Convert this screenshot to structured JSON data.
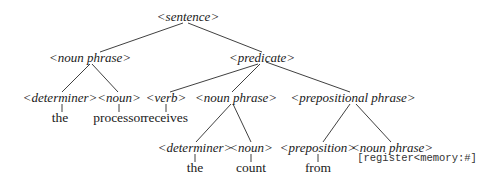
{
  "diagram": {
    "type": "parse-tree",
    "nodes": {
      "sentence": {
        "label": "<sentence>",
        "x": 188,
        "y": 17
      },
      "np1": {
        "label": "<noun phrase>",
        "x": 90,
        "y": 58
      },
      "predicate": {
        "label": "<predicate>",
        "x": 262,
        "y": 58
      },
      "det1": {
        "label": "<determiner>",
        "x": 60,
        "y": 98
      },
      "noun1": {
        "label": "<noun>",
        "x": 119,
        "y": 98
      },
      "verb": {
        "label": "<verb>",
        "x": 166,
        "y": 98
      },
      "np2": {
        "label": "<noun phrase>",
        "x": 236,
        "y": 98
      },
      "pp": {
        "label": "<prepositional phrase>",
        "x": 353,
        "y": 98
      },
      "det2": {
        "label": "<determiner>",
        "x": 195,
        "y": 148
      },
      "noun2": {
        "label": "<noun>",
        "x": 251,
        "y": 148
      },
      "prep": {
        "label": "<preposition>",
        "x": 318,
        "y": 148
      },
      "np3": {
        "label": "<noun phrase>",
        "x": 392,
        "y": 148
      }
    },
    "leaves": {
      "the1": {
        "label": "the",
        "x": 60,
        "y": 118
      },
      "processor": {
        "label": "processor",
        "x": 119,
        "y": 118
      },
      "receives": {
        "label": "receives",
        "x": 166,
        "y": 118
      },
      "the2": {
        "label": "the",
        "x": 195,
        "y": 168
      },
      "count": {
        "label": "count",
        "x": 251,
        "y": 168
      },
      "from": {
        "label": "from",
        "x": 318,
        "y": 168
      }
    },
    "annotation": {
      "label": "[register<memory:#]",
      "x": 417,
      "y": 158
    },
    "edges": [
      {
        "from": "sentence",
        "to": "np1",
        "x1": 183,
        "y1": 23,
        "x2": 100,
        "y2": 52
      },
      {
        "from": "sentence",
        "to": "predicate",
        "x1": 188,
        "y1": 23,
        "x2": 262,
        "y2": 52
      },
      {
        "from": "np1",
        "to": "det1",
        "x1": 90,
        "y1": 64,
        "x2": 62,
        "y2": 92
      },
      {
        "from": "np1",
        "to": "noun1",
        "x1": 92,
        "y1": 64,
        "x2": 118,
        "y2": 92
      },
      {
        "from": "predicate",
        "to": "verb",
        "x1": 258,
        "y1": 64,
        "x2": 170,
        "y2": 92
      },
      {
        "from": "predicate",
        "to": "np2",
        "x1": 260,
        "y1": 64,
        "x2": 232,
        "y2": 92
      },
      {
        "from": "predicate",
        "to": "pp",
        "x1": 266,
        "y1": 62,
        "x2": 350,
        "y2": 92
      },
      {
        "from": "det1",
        "to": "the1",
        "x1": 62,
        "y1": 104,
        "x2": 62,
        "y2": 112
      },
      {
        "from": "noun1",
        "to": "processor",
        "x1": 119,
        "y1": 104,
        "x2": 119,
        "y2": 112
      },
      {
        "from": "verb",
        "to": "receives",
        "x1": 166,
        "y1": 104,
        "x2": 166,
        "y2": 112
      },
      {
        "from": "np2",
        "to": "det2",
        "x1": 231,
        "y1": 104,
        "x2": 196,
        "y2": 142
      },
      {
        "from": "np2",
        "to": "noun2",
        "x1": 233,
        "y1": 104,
        "x2": 251,
        "y2": 142
      },
      {
        "from": "pp",
        "to": "prep",
        "x1": 350,
        "y1": 104,
        "x2": 323,
        "y2": 142
      },
      {
        "from": "pp",
        "to": "np3",
        "x1": 356,
        "y1": 104,
        "x2": 391,
        "y2": 142
      },
      {
        "from": "det2",
        "to": "the2",
        "x1": 195,
        "y1": 154,
        "x2": 195,
        "y2": 162
      },
      {
        "from": "noun2",
        "to": "count",
        "x1": 251,
        "y1": 154,
        "x2": 251,
        "y2": 162
      },
      {
        "from": "prep",
        "to": "from",
        "x1": 318,
        "y1": 154,
        "x2": 318,
        "y2": 162
      }
    ]
  }
}
